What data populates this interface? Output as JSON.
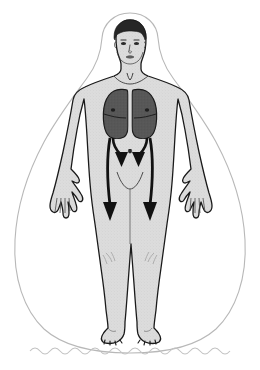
{
  "illustration": {
    "title": "Human body anatomical diagram with lungs and downward flow arrows",
    "subject": "standing human figure, front view",
    "canvas": {
      "width": 260,
      "height": 370,
      "background": "#ffffff"
    }
  },
  "colors": {
    "background": "#ffffff",
    "body_fill": "#dcdcdc",
    "body_outline": "#1a1a1a",
    "lung_fill": "#575757",
    "lung_outline": "#1a1a1a",
    "hair_fill": "#262626",
    "arrow_fill": "#111111",
    "aura_outline": "#b8b8b8",
    "wave_line": "#c2c2c2",
    "shading": "#b0b0b0"
  },
  "parts": {
    "aura": {
      "name": "aura-outline",
      "shape": "teardrop / pear-shaped halo surrounding the body",
      "stroke_width": 1
    },
    "wave": {
      "name": "ground-wave-line",
      "shape": "sinusoidal wavy line across the bottom",
      "cycles": 11
    },
    "head": {
      "name": "head",
      "features": [
        "hair",
        "eyes",
        "nose",
        "mouth",
        "ears"
      ]
    },
    "neck": {
      "name": "neck"
    },
    "torso": {
      "name": "torso",
      "features": [
        "clavicle",
        "navel",
        "pelvic-curve"
      ]
    },
    "arms": {
      "name": "arms",
      "count": 2,
      "features": [
        "hands",
        "fingers"
      ]
    },
    "legs": {
      "name": "legs",
      "count": 2,
      "features": [
        "knees",
        "feet",
        "toes"
      ]
    },
    "lungs": {
      "name": "lungs",
      "count": 2,
      "labels": [
        "left-lung",
        "right-lung"
      ],
      "fill": "#575757"
    }
  },
  "arrows": [
    {
      "id": "inner-left-arrow",
      "label": "short inner arrow, left",
      "direction": "down",
      "length": "short"
    },
    {
      "id": "inner-right-arrow",
      "label": "short inner arrow, right",
      "direction": "down",
      "length": "short"
    },
    {
      "id": "outer-left-arrow",
      "label": "long outer arrow, left",
      "direction": "down",
      "length": "long"
    },
    {
      "id": "outer-right-arrow",
      "label": "long outer arrow, right",
      "direction": "down",
      "length": "long"
    }
  ]
}
